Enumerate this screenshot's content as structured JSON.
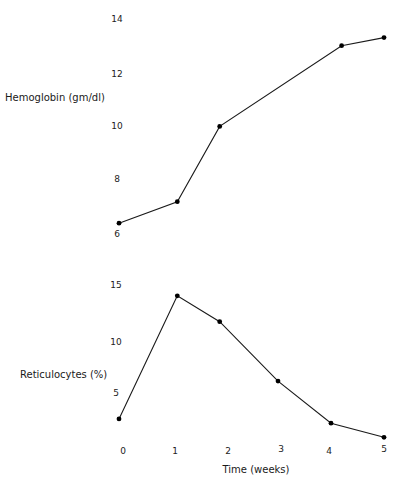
{
  "chart_data": [
    {
      "type": "line",
      "title": "",
      "xlabel": "",
      "ylabel": "Hemoglobin (gm/dl)",
      "x": [
        0,
        1.1,
        1.9,
        4.2,
        5.0
      ],
      "values": [
        6.4,
        7.2,
        10.0,
        13.0,
        13.3
      ],
      "series": [
        {
          "name": "Hemoglobin",
          "x": [
            0,
            1.1,
            1.9,
            4.2,
            5.0
          ],
          "values": [
            6.4,
            7.2,
            10.0,
            13.0,
            13.3
          ]
        }
      ],
      "y_ticks": [
        "14",
        "12",
        "10",
        "8",
        "6"
      ],
      "ylim": [
        6,
        14
      ],
      "xlim": [
        0,
        5
      ],
      "grid": false,
      "markers": "filled-circle"
    },
    {
      "type": "line",
      "title": "",
      "xlabel": "Time (weeks)",
      "ylabel": "Reticulocytes (%)",
      "x": [
        0,
        1.1,
        1.9,
        3.0,
        4.0,
        5.0
      ],
      "values": [
        2.6,
        14.0,
        11.6,
        6.1,
        2.2,
        0.9
      ],
      "series": [
        {
          "name": "Reticulocytes",
          "x": [
            0,
            1.1,
            1.9,
            3.0,
            4.0,
            5.0
          ],
          "values": [
            2.6,
            14.0,
            11.6,
            6.1,
            2.2,
            0.9
          ]
        }
      ],
      "y_ticks": [
        "15",
        "10",
        "5"
      ],
      "x_ticks": [
        "0",
        "1",
        "2",
        "3",
        "4",
        "5"
      ],
      "ylim": [
        0,
        15
      ],
      "xlim": [
        0,
        5
      ],
      "grid": false,
      "markers": "filled-circle"
    }
  ],
  "labels": {
    "hemoglobin_axis": "Hemoglobin (gm/dl)",
    "reticulocytes_axis": "Reticulocytes (%)",
    "time_axis": "Time (weeks)"
  },
  "colors": {
    "line": "#1a1a1a",
    "background": "#ffffff"
  }
}
